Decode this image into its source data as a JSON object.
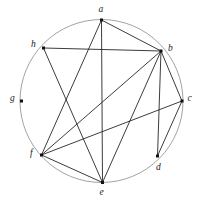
{
  "figure": {
    "name": "circular-graph-diagram",
    "type": "undirected-graph",
    "background_color": "#ffffff",
    "line_color": "#262626",
    "circle_color": "#8a8a8a",
    "vertex_color": "#111111"
  },
  "circle": {
    "cx": 101.5,
    "cy": 101,
    "r": 81.5,
    "stroke_width": 0.8
  },
  "vertices": [
    {
      "id": "a",
      "label": "a",
      "x": 101.5,
      "y": 20.0,
      "label_x": 98.5,
      "label_y": 5.0
    },
    {
      "id": "b",
      "label": "b",
      "x": 161.0,
      "y": 51.0,
      "label_x": 168.0,
      "label_y": 44.0
    },
    {
      "id": "c",
      "label": "c",
      "x": 182.0,
      "y": 101.0,
      "label_x": 187.5,
      "label_y": 94.0
    },
    {
      "id": "d",
      "label": "d",
      "x": 157.5,
      "y": 156.0,
      "label_x": 156.0,
      "label_y": 163.0
    },
    {
      "id": "e",
      "label": "e",
      "x": 102.5,
      "y": 182.5,
      "label_x": 99.5,
      "label_y": 188.0
    },
    {
      "id": "f",
      "label": "f",
      "x": 41.5,
      "y": 155.0,
      "label_x": 30.0,
      "label_y": 149.0
    },
    {
      "id": "g",
      "label": "g",
      "x": 21.5,
      "y": 101.0,
      "label_x": 10.0,
      "label_y": 94.0
    },
    {
      "id": "h",
      "label": "h",
      "x": 43.5,
      "y": 48.0,
      "label_x": 31.0,
      "label_y": 40.0
    }
  ],
  "edges": [
    {
      "from": "a",
      "to": "b"
    },
    {
      "from": "a",
      "to": "e"
    },
    {
      "from": "a",
      "to": "f"
    },
    {
      "from": "b",
      "to": "h"
    },
    {
      "from": "b",
      "to": "c"
    },
    {
      "from": "b",
      "to": "d"
    },
    {
      "from": "b",
      "to": "e"
    },
    {
      "from": "b",
      "to": "f"
    },
    {
      "from": "c",
      "to": "d"
    },
    {
      "from": "c",
      "to": "f"
    },
    {
      "from": "e",
      "to": "f"
    },
    {
      "from": "e",
      "to": "h"
    }
  ],
  "isolated_vertices": [
    "g"
  ],
  "vertex_marker": {
    "size": 3.0,
    "shape": "square"
  },
  "edge_stroke_width": 0.9
}
